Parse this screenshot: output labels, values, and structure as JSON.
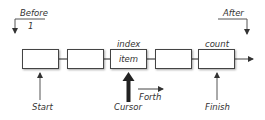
{
  "diagram": {
    "before": {
      "label": "Before",
      "index": "1"
    },
    "after": {
      "label": "After"
    },
    "boxes": [
      {
        "content": "",
        "top_label": ""
      },
      {
        "content": "",
        "top_label": ""
      },
      {
        "content": "item",
        "top_label": "index"
      },
      {
        "content": "",
        "top_label": ""
      },
      {
        "content": "",
        "top_label": "count"
      }
    ],
    "pointers": {
      "start": "Start",
      "cursor": "Cursor",
      "forth": "Forth",
      "finish": "Finish"
    },
    "colors": {
      "line": "#444444",
      "text": "#333333",
      "cursor_arrow": "#222222"
    }
  }
}
